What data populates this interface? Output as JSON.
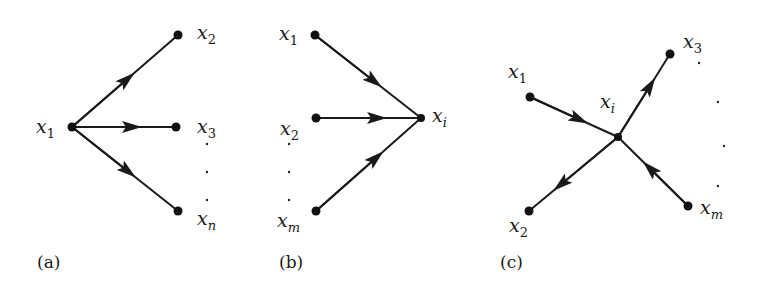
{
  "figure": {
    "panels": [
      {
        "id": "a",
        "caption": "(a)",
        "nodes": [
          {
            "id": "x1",
            "var": "x",
            "sub": "1",
            "sub_italic": false
          },
          {
            "id": "x2",
            "var": "x",
            "sub": "2",
            "sub_italic": false
          },
          {
            "id": "x3",
            "var": "x",
            "sub": "3",
            "sub_italic": false
          },
          {
            "id": "xn",
            "var": "x",
            "sub": "n",
            "sub_italic": true
          }
        ],
        "edges": [
          {
            "from": "x1",
            "to": "x2"
          },
          {
            "from": "x1",
            "to": "x3"
          },
          {
            "from": "x1",
            "to": "xn"
          }
        ],
        "ellipsis": "vertical dots between x3 and xn"
      },
      {
        "id": "b",
        "caption": "(b)",
        "nodes": [
          {
            "id": "x1",
            "var": "x",
            "sub": "1",
            "sub_italic": false
          },
          {
            "id": "x2",
            "var": "x",
            "sub": "2",
            "sub_italic": false
          },
          {
            "id": "xm",
            "var": "x",
            "sub": "m",
            "sub_italic": true
          },
          {
            "id": "xi",
            "var": "x",
            "sub": "i",
            "sub_italic": true
          }
        ],
        "edges": [
          {
            "from": "x1",
            "to": "xi"
          },
          {
            "from": "x2",
            "to": "xi"
          },
          {
            "from": "xm",
            "to": "xi"
          }
        ],
        "ellipsis": "vertical dots between x2 and xm"
      },
      {
        "id": "c",
        "caption": "(c)",
        "nodes": [
          {
            "id": "x1",
            "var": "x",
            "sub": "1",
            "sub_italic": false
          },
          {
            "id": "xi",
            "var": "x",
            "sub": "i",
            "sub_italic": true
          },
          {
            "id": "x3",
            "var": "x",
            "sub": "3",
            "sub_italic": false
          },
          {
            "id": "x2",
            "var": "x",
            "sub": "2",
            "sub_italic": false
          },
          {
            "id": "xm",
            "var": "x",
            "sub": "m",
            "sub_italic": true
          }
        ],
        "edges": [
          {
            "from": "x1",
            "to": "xi"
          },
          {
            "from": "xi",
            "to": "x3"
          },
          {
            "from": "xi",
            "to": "x2"
          },
          {
            "from": "xm",
            "to": "xi"
          }
        ],
        "ellipsis": "vertical dots between x3 and xm"
      }
    ]
  }
}
